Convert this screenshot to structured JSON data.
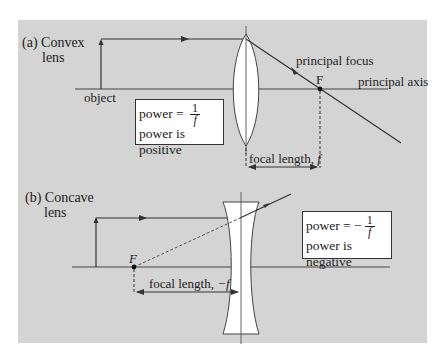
{
  "figure": {
    "panel_color": "#d4d4d4",
    "line_color": "#333333",
    "lens_fill": "#ffffff",
    "convex": {
      "section_label": "(a) Convex",
      "section_label_line2": "lens",
      "object_label": "object",
      "principal_focus_label": "principal focus",
      "focus_marker": "F",
      "principal_axis_label": "principal axis",
      "focal_length_label": "focal length, ",
      "focal_length_symbol": "f",
      "power_box": {
        "prefix": "power = ",
        "numerator": "1",
        "denominator": "f",
        "line2": "power is positive"
      }
    },
    "concave": {
      "section_label": "(b) Concave",
      "section_label_line2": "lens",
      "focus_marker": "F",
      "focal_length_label": "focal length, ",
      "focal_length_symbol": "−f",
      "power_box": {
        "prefix": "power = −",
        "numerator": "1",
        "denominator": "f",
        "line2": "power is negative"
      }
    }
  }
}
